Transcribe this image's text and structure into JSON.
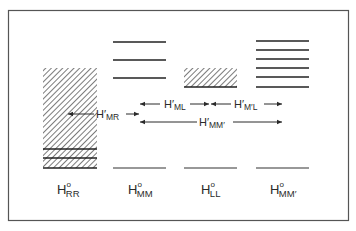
{
  "figure": {
    "columns": [
      {
        "id": "RR",
        "label_main": "H",
        "label_sup": "o",
        "label_sub": "RR",
        "x": 43,
        "width": 54,
        "levels": "continuum-band-with-lines"
      },
      {
        "id": "MM",
        "label_main": "H",
        "label_sup": "o",
        "label_sub": "MM",
        "x": 113,
        "width": 53,
        "levels": "three-discrete-lines"
      },
      {
        "id": "LL",
        "label_main": "H",
        "label_sup": "o",
        "label_sub": "LL",
        "x": 184,
        "width": 53,
        "levels": "narrow-band"
      },
      {
        "id": "MMp",
        "label_main": "H",
        "label_sup": "o",
        "label_sub": "MM′",
        "x": 256,
        "width": 53,
        "levels": "six-discrete-lines"
      }
    ],
    "couplings": [
      {
        "id": "MR",
        "label_main": "H′",
        "label_sub": "MR"
      },
      {
        "id": "ML",
        "label_main": "H′",
        "label_sub": "ML"
      },
      {
        "id": "MpL",
        "label_main": "H′",
        "label_sub": "M′L"
      },
      {
        "id": "MMp",
        "label_main": "H′",
        "label_sub": "MM′"
      }
    ],
    "colors": {
      "ink": "#2a2a2a",
      "frame": "#555555",
      "background": "#ffffff"
    }
  }
}
